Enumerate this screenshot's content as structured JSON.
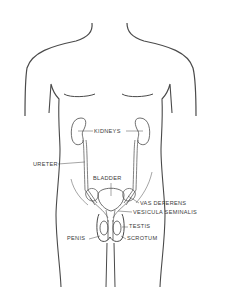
{
  "diagram": {
    "colors": {
      "line": "#4a4a4a",
      "text": "#3a3a3a",
      "background": "#ffffff"
    },
    "labels": {
      "kidneys": "KIDNEYS",
      "ureter": "URETER",
      "bladder": "BLADDER",
      "vas_deferens": "VAS DEFERENS",
      "vesicula_seminalis": "VESICULA SEMINALIS",
      "testis": "TESTIS",
      "penis": "PENIS",
      "scrotum": "SCROTUM"
    }
  }
}
